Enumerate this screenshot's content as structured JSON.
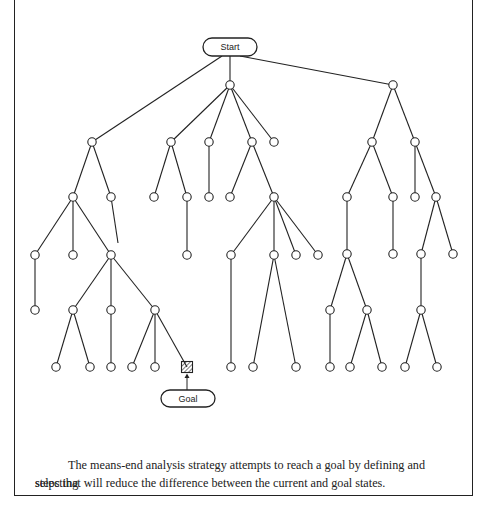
{
  "diagram": {
    "start_label": "Start",
    "goal_label": "Goal",
    "colors": {
      "stroke": "#222222",
      "hatch": "#222222",
      "background": "#ffffff"
    },
    "start_box": {
      "x": 203,
      "y": 38,
      "w": 54,
      "h": 18
    },
    "goal_box": {
      "x": 161,
      "y": 390,
      "w": 54,
      "h": 17
    },
    "goal_node": {
      "x": 187,
      "y": 367
    },
    "nodes": [
      [
        230,
        85
      ],
      [
        393,
        85
      ],
      [
        92,
        142
      ],
      [
        171,
        142
      ],
      [
        209,
        142
      ],
      [
        252,
        142
      ],
      [
        274,
        142
      ],
      [
        372,
        142
      ],
      [
        415,
        142
      ],
      [
        73,
        197
      ],
      [
        111,
        197
      ],
      [
        154,
        197
      ],
      [
        187,
        197
      ],
      [
        209,
        197
      ],
      [
        230,
        197
      ],
      [
        274,
        197
      ],
      [
        347,
        197
      ],
      [
        393,
        197
      ],
      [
        415,
        197
      ],
      [
        436,
        197
      ],
      [
        35,
        255
      ],
      [
        73,
        255
      ],
      [
        111,
        255
      ],
      [
        187,
        255
      ],
      [
        231,
        255
      ],
      [
        274,
        255
      ],
      [
        296,
        255
      ],
      [
        318,
        255
      ],
      [
        347,
        254
      ],
      [
        393,
        254
      ],
      [
        421,
        254
      ],
      [
        453,
        254
      ],
      [
        35,
        310
      ],
      [
        73,
        310
      ],
      [
        111,
        310
      ],
      [
        155,
        310
      ],
      [
        330,
        310
      ],
      [
        367,
        310
      ],
      [
        421,
        310
      ],
      [
        56,
        367
      ],
      [
        90,
        367
      ],
      [
        111,
        367
      ],
      [
        132,
        367
      ],
      [
        155,
        367
      ],
      [
        231,
        367
      ],
      [
        253,
        367
      ],
      [
        296,
        367
      ],
      [
        330,
        367
      ],
      [
        350,
        367
      ],
      [
        382,
        367
      ],
      [
        405,
        367
      ],
      [
        437,
        367
      ]
    ],
    "edges": [
      [
        [
          222,
          56
        ],
        [
          92,
          142
        ]
      ],
      [
        [
          230,
          56
        ],
        [
          230,
          85
        ]
      ],
      [
        [
          240,
          56
        ],
        [
          393,
          85
        ]
      ],
      [
        [
          230,
          85
        ],
        [
          171,
          142
        ]
      ],
      [
        [
          230,
          85
        ],
        [
          209,
          142
        ]
      ],
      [
        [
          230,
          85
        ],
        [
          252,
          142
        ]
      ],
      [
        [
          230,
          85
        ],
        [
          274,
          142
        ]
      ],
      [
        [
          393,
          85
        ],
        [
          372,
          142
        ]
      ],
      [
        [
          393,
          85
        ],
        [
          415,
          142
        ]
      ],
      [
        [
          92,
          142
        ],
        [
          73,
          197
        ]
      ],
      [
        [
          92,
          142
        ],
        [
          111,
          197
        ]
      ],
      [
        [
          171,
          142
        ],
        [
          154,
          197
        ]
      ],
      [
        [
          171,
          142
        ],
        [
          187,
          197
        ]
      ],
      [
        [
          209,
          142
        ],
        [
          209,
          197
        ]
      ],
      [
        [
          252,
          142
        ],
        [
          230,
          197
        ]
      ],
      [
        [
          252,
          142
        ],
        [
          274,
          197
        ]
      ],
      [
        [
          372,
          142
        ],
        [
          347,
          197
        ]
      ],
      [
        [
          372,
          142
        ],
        [
          393,
          197
        ]
      ],
      [
        [
          415,
          142
        ],
        [
          415,
          197
        ]
      ],
      [
        [
          415,
          142
        ],
        [
          436,
          197
        ]
      ],
      [
        [
          73,
          197
        ],
        [
          35,
          255
        ]
      ],
      [
        [
          73,
          197
        ],
        [
          73,
          255
        ]
      ],
      [
        [
          73,
          197
        ],
        [
          111,
          255
        ]
      ],
      [
        [
          111,
          197
        ],
        [
          118,
          243
        ]
      ],
      [
        [
          187,
          197
        ],
        [
          187,
          255
        ]
      ],
      [
        [
          274,
          197
        ],
        [
          231,
          255
        ]
      ],
      [
        [
          274,
          197
        ],
        [
          274,
          255
        ]
      ],
      [
        [
          274,
          197
        ],
        [
          296,
          255
        ]
      ],
      [
        [
          274,
          197
        ],
        [
          318,
          255
        ]
      ],
      [
        [
          347,
          197
        ],
        [
          347,
          254
        ]
      ],
      [
        [
          393,
          197
        ],
        [
          393,
          254
        ]
      ],
      [
        [
          436,
          197
        ],
        [
          421,
          254
        ]
      ],
      [
        [
          436,
          197
        ],
        [
          453,
          254
        ]
      ],
      [
        [
          35,
          255
        ],
        [
          35,
          310
        ]
      ],
      [
        [
          111,
          255
        ],
        [
          73,
          310
        ]
      ],
      [
        [
          111,
          255
        ],
        [
          111,
          310
        ]
      ],
      [
        [
          111,
          255
        ],
        [
          155,
          310
        ]
      ],
      [
        [
          347,
          254
        ],
        [
          330,
          310
        ]
      ],
      [
        [
          347,
          254
        ],
        [
          367,
          310
        ]
      ],
      [
        [
          421,
          254
        ],
        [
          421,
          310
        ]
      ],
      [
        [
          73,
          310
        ],
        [
          56,
          367
        ]
      ],
      [
        [
          73,
          310
        ],
        [
          90,
          367
        ]
      ],
      [
        [
          111,
          310
        ],
        [
          111,
          367
        ]
      ],
      [
        [
          155,
          310
        ],
        [
          132,
          367
        ]
      ],
      [
        [
          155,
          310
        ],
        [
          155,
          367
        ]
      ],
      [
        [
          155,
          310
        ],
        [
          187,
          367
        ]
      ],
      [
        [
          231,
          255
        ],
        [
          231,
          367
        ]
      ],
      [
        [
          274,
          255
        ],
        [
          253,
          367
        ]
      ],
      [
        [
          274,
          255
        ],
        [
          296,
          367
        ]
      ],
      [
        [
          330,
          310
        ],
        [
          330,
          367
        ]
      ],
      [
        [
          367,
          310
        ],
        [
          350,
          367
        ]
      ],
      [
        [
          367,
          310
        ],
        [
          382,
          367
        ]
      ],
      [
        [
          421,
          310
        ],
        [
          405,
          367
        ]
      ],
      [
        [
          421,
          310
        ],
        [
          437,
          367
        ]
      ]
    ]
  },
  "caption": {
    "line1": "The means-end analysis strategy attempts to reach a goal by defining and selecting",
    "line2": "steps that will reduce the difference between the current and goal states."
  }
}
